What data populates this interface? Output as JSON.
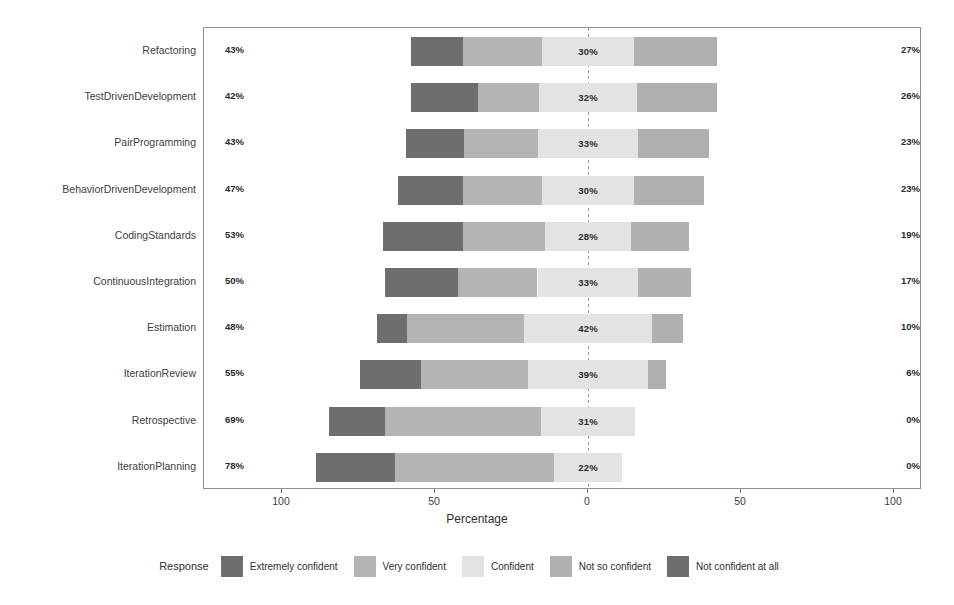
{
  "chart_data": {
    "type": "bar",
    "subtype": "diverging-stacked-bar",
    "title": "",
    "xlabel": "Percentage",
    "ylabel": "",
    "xlim": [
      -100,
      100
    ],
    "xticks": [
      {
        "value": -100,
        "label": "100"
      },
      {
        "value": -50,
        "label": "50"
      },
      {
        "value": 0,
        "label": "0"
      },
      {
        "value": 50,
        "label": "50"
      },
      {
        "value": 100,
        "label": "100"
      }
    ],
    "grid": false,
    "zero_line": true,
    "legend_position": "bottom",
    "legend_title": "Response",
    "categories": [
      "Refactoring",
      "TestDrivenDevelopment",
      "PairProgramming",
      "BehaviorDrivenDevelopment",
      "CodingStandards",
      "ContinuousIntegration",
      "Estimation",
      "IterationReview",
      "Retrospective",
      "IterationPlanning"
    ],
    "series": [
      {
        "name": "Extremely confident",
        "color": "#6e6e6e",
        "values": [
          17,
          22,
          19,
          21,
          26,
          24,
          10,
          20,
          18,
          26
        ]
      },
      {
        "name": "Very confident",
        "color": "#b4b4b4",
        "values": [
          26,
          20,
          24,
          26,
          27,
          26,
          38,
          35,
          51,
          52
        ]
      },
      {
        "name": "Confident",
        "color": "#e3e3e3",
        "values": [
          30,
          32,
          33,
          30,
          28,
          33,
          42,
          39,
          31,
          22
        ]
      },
      {
        "name": "Not so confident",
        "color": "#b0b0b0",
        "values": [
          27,
          26,
          23,
          23,
          19,
          17,
          10,
          6,
          0,
          0
        ]
      },
      {
        "name": "Not confident at all",
        "color": "#6e6e6e",
        "values": [
          0,
          0,
          0,
          0,
          0,
          0,
          0,
          0,
          0,
          0
        ]
      }
    ],
    "center_labels": [
      "30%",
      "32%",
      "33%",
      "30%",
      "28%",
      "33%",
      "42%",
      "39%",
      "31%",
      "22%"
    ],
    "left_totals": [
      "43%",
      "42%",
      "43%",
      "47%",
      "53%",
      "50%",
      "48%",
      "55%",
      "69%",
      "78%"
    ],
    "right_totals": [
      "27%",
      "26%",
      "23%",
      "23%",
      "19%",
      "17%",
      "10%",
      "6%",
      "0%",
      "0%"
    ]
  },
  "axis": {
    "title": "Percentage"
  },
  "legend": {
    "title": "Response",
    "items": [
      {
        "label": "Extremely confident",
        "color": "#6e6e6e"
      },
      {
        "label": "Very confident",
        "color": "#b4b4b4"
      },
      {
        "label": "Confident",
        "color": "#e3e3e3"
      },
      {
        "label": "Not so confident",
        "color": "#b0b0b0"
      },
      {
        "label": "Not confident at all",
        "color": "#6e6e6e"
      }
    ]
  }
}
